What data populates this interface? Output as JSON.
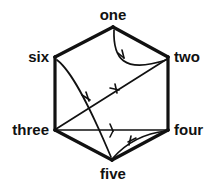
{
  "diagram": {
    "type": "directed-graph",
    "shape": "hexagon",
    "title": "",
    "stroke_color": "#111111",
    "background_color": "#ffffff",
    "vertices": [
      {
        "id": "one",
        "label": "one",
        "x": 113,
        "y": 27,
        "label_position": "top"
      },
      {
        "id": "two",
        "label": "two",
        "x": 168,
        "y": 57,
        "label_position": "right"
      },
      {
        "id": "four",
        "label": "four",
        "x": 168,
        "y": 130,
        "label_position": "right"
      },
      {
        "id": "five",
        "label": "five",
        "x": 112,
        "y": 160,
        "label_position": "bottom"
      },
      {
        "id": "three",
        "label": "three",
        "x": 55,
        "y": 130,
        "label_position": "left"
      },
      {
        "id": "six",
        "label": "six",
        "x": 55,
        "y": 57,
        "label_position": "left"
      }
    ],
    "edges": [
      {
        "from": "six",
        "to": "one",
        "style": "straight",
        "directed": false,
        "thickness": 3
      },
      {
        "from": "one",
        "to": "two",
        "style": "straight",
        "directed": false,
        "thickness": 3
      },
      {
        "from": "two",
        "to": "four",
        "style": "straight",
        "directed": false,
        "thickness": 3
      },
      {
        "from": "four",
        "to": "five",
        "style": "straight",
        "directed": false,
        "thickness": 3
      },
      {
        "from": "five",
        "to": "three",
        "style": "straight",
        "directed": false,
        "thickness": 3
      },
      {
        "from": "three",
        "to": "six",
        "style": "straight",
        "directed": false,
        "thickness": 3
      },
      {
        "from": "one",
        "to": "two",
        "style": "curved",
        "directed": true,
        "thickness": 1.6,
        "arrow_at": 0.45
      },
      {
        "from": "six",
        "to": "five",
        "style": "curved",
        "directed": true,
        "thickness": 1.6,
        "arrow_at": 0.45
      },
      {
        "from": "three",
        "to": "two",
        "style": "straight",
        "directed": true,
        "thickness": 1.6,
        "arrow_at": 0.55
      },
      {
        "from": "three",
        "to": "four",
        "style": "straight",
        "directed": true,
        "thickness": 1.6,
        "arrow_at": 0.52
      },
      {
        "from": "four",
        "to": "five",
        "style": "curved",
        "directed": true,
        "thickness": 1.6,
        "arrow_at": 0.48
      }
    ]
  },
  "labels": {
    "one": "one",
    "two": "two",
    "three": "three",
    "four": "four",
    "five": "five",
    "six": "six"
  }
}
